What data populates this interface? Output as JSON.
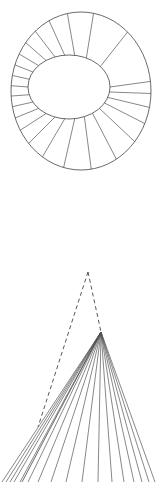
{
  "document": {
    "title": "Geometric Construction Drawing",
    "background_color": "#ffffff",
    "width": 160,
    "height": 482,
    "line_color": "#444444",
    "dashed_line_color": "#3a3a3a"
  },
  "figures": [
    {
      "id": "annulus-rosette",
      "name": "Segmented Annulus (Development of Cone Base)",
      "type": "ellipse-annulus-with-radial-spokes",
      "outer_ellipse": {
        "cx": 81,
        "cy": 91,
        "rx": 70,
        "ry": 79
      },
      "inner_ellipse": {
        "cx": 69,
        "cy": 87,
        "rx": 41,
        "ry": 32
      },
      "spoke_count": 24,
      "spoke_angles_deg": [
        0,
        9,
        19,
        30,
        42,
        55,
        68,
        82,
        96,
        110,
        124,
        138,
        152,
        166,
        180,
        194,
        208,
        222,
        236,
        250,
        264,
        278,
        295,
        320
      ]
    },
    {
      "id": "cone-perspective",
      "name": "Cone Generatrix Fan with Construction Lines",
      "type": "fan-of-lines-with-dashed-construction",
      "true_apex": {
        "x": 88,
        "y": 272
      },
      "projected_apex": {
        "x": 101,
        "y": 332
      },
      "left_vertex": {
        "x": 38,
        "y": 427
      },
      "dashed_segments": [
        {
          "x1": 88,
          "y1": 272,
          "x2": 38,
          "y2": 427
        },
        {
          "x1": 88,
          "y1": 272,
          "x2": 101,
          "y2": 332
        }
      ],
      "generatrix_count": 16,
      "generatrix_endpoints_x": [
        2,
        6,
        10,
        14,
        20,
        28,
        38,
        51,
        66,
        82,
        98,
        112,
        124,
        134,
        142,
        149,
        155
      ],
      "baseline_y": 482,
      "left_edge_line": {
        "x1": 101,
        "y1": 332,
        "x2": 22,
        "y2": 482
      }
    }
  ]
}
